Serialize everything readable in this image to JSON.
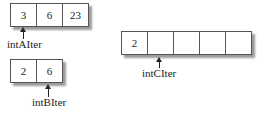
{
  "arrays": {
    "A": {
      "cells": [
        "3",
        "6",
        "23"
      ],
      "pointer_label": "intAIter",
      "pointer_index": 0
    },
    "B": {
      "cells": [
        "2",
        "6"
      ],
      "pointer_label": "intBIter",
      "pointer_index": 1
    },
    "C": {
      "cells": [
        "2",
        "",
        "",
        "",
        ""
      ],
      "pointer_label": "intCIter",
      "pointer_index": 1
    }
  },
  "colors": {
    "border": "#555555",
    "shadow": "#9a9a9a",
    "text": "#222222"
  }
}
